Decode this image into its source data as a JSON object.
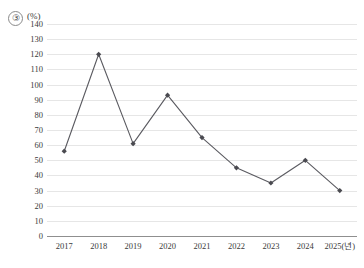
{
  "figure": {
    "item_number": "③",
    "unit_label": "(%)"
  },
  "chart_data": {
    "type": "line",
    "title": "",
    "xlabel": "2025(년)",
    "ylabel": "(%)",
    "categories": [
      "2017",
      "2018",
      "2019",
      "2020",
      "2021",
      "2022",
      "2023",
      "2024",
      "2025(년)"
    ],
    "values": [
      56,
      120,
      61,
      93,
      65,
      45,
      35,
      50,
      30
    ],
    "ylim": [
      0,
      140
    ],
    "ytick_step": 10,
    "yticks": [
      0,
      10,
      20,
      30,
      40,
      50,
      60,
      70,
      80,
      90,
      100,
      110,
      120,
      130,
      140
    ],
    "ytick_labels": [
      "0",
      "10",
      "20",
      "30",
      "40",
      "50",
      "60",
      "70",
      "80",
      "90",
      "100",
      "110",
      "120",
      "130",
      "140"
    ],
    "grid": true,
    "legend": false,
    "marker": "diamond",
    "line_color": "#5a5a60",
    "marker_color": "#4a4a50",
    "grid_color": "#e6e6e6",
    "axis_color": "#8f8f8f"
  }
}
